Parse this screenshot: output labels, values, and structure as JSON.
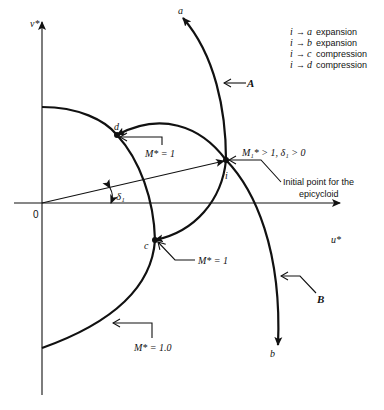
{
  "diagram": {
    "axes": {
      "vertical_label": "v*",
      "horizontal_label": "u*",
      "origin_label": "0"
    },
    "angle_label": "δ₁",
    "points": {
      "a": "a",
      "b": "b",
      "c": "c",
      "d": "d",
      "i": "i"
    },
    "curve_labels": {
      "A": "A",
      "B": "B"
    },
    "annotations": {
      "m_star_d": "M* = 1",
      "m_star_c": "M* = 1",
      "m_star_circle": "M* = 1.0",
      "initial_condition": "M₁* > 1, δ₁ > 0",
      "initial_point_line1": "Initial point for the",
      "initial_point_line2": "epicycloid"
    },
    "legend": [
      {
        "from": "i",
        "arrow": "→",
        "to": "a",
        "text": "expansion"
      },
      {
        "from": "i",
        "arrow": "→",
        "to": "b",
        "text": "expansion"
      },
      {
        "from": "i",
        "arrow": "→",
        "to": "c",
        "text": "compression"
      },
      {
        "from": "i",
        "arrow": "→",
        "to": "d",
        "text": "compression"
      }
    ]
  }
}
